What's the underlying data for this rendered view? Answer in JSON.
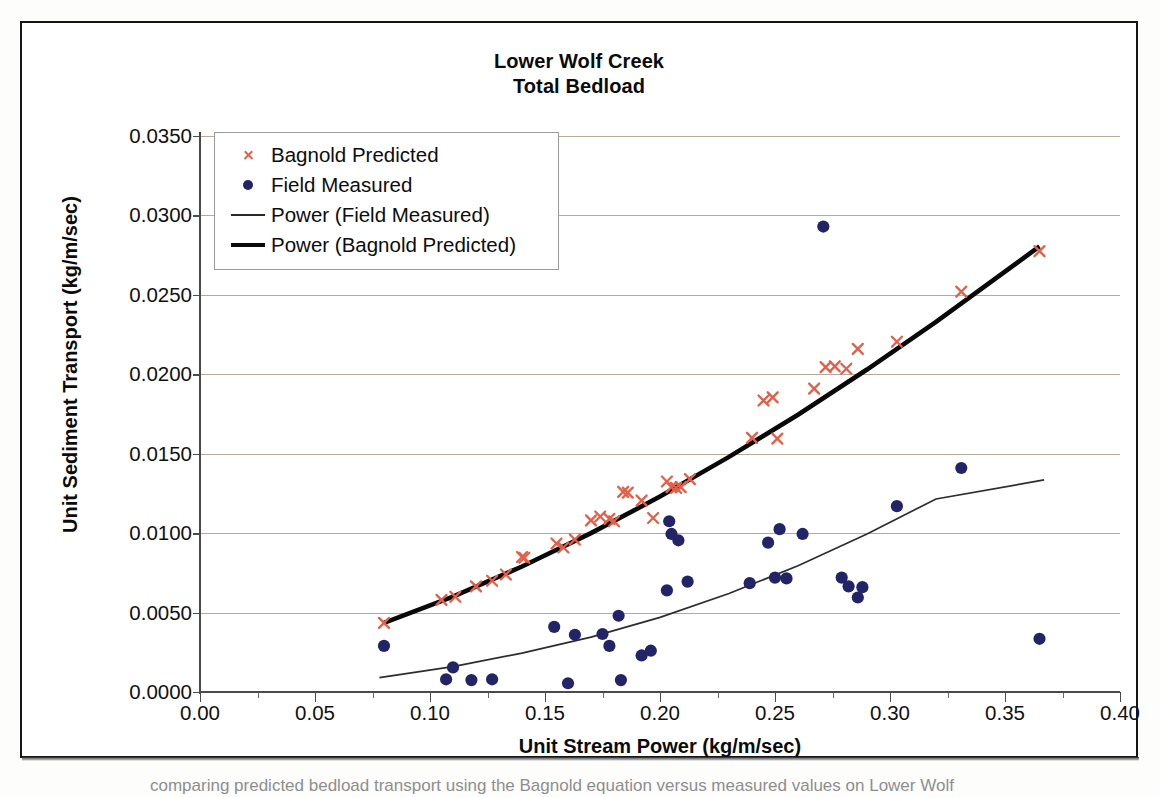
{
  "chart_data": {
    "type": "scatter",
    "title": "Lower Wolf Creek",
    "subtitle": "Total Bedload",
    "xlabel": "Unit Stream Power (kg/m/sec)",
    "ylabel": "Unit Sediment Transport (kg/m/sec)",
    "xlim": [
      0.0,
      0.4
    ],
    "ylim": [
      0.0,
      0.035
    ],
    "xticks": [
      "0.00",
      "0.05",
      "0.10",
      "0.15",
      "0.20",
      "0.25",
      "0.30",
      "0.35",
      "0.40"
    ],
    "xtick_values": [
      0.0,
      0.05,
      0.1,
      0.15,
      0.2,
      0.25,
      0.3,
      0.35,
      0.4
    ],
    "yticks": [
      "0.0000",
      "0.0050",
      "0.0100",
      "0.0150",
      "0.0200",
      "0.0250",
      "0.0300",
      "0.0350"
    ],
    "ytick_values": [
      0.0,
      0.005,
      0.01,
      0.015,
      0.02,
      0.025,
      0.03,
      0.035
    ],
    "grid": "horizontal",
    "legend_position": "upper-left-inside",
    "colors": {
      "bagnold_predicted": "#e2604a",
      "field_measured": "#232467",
      "power_field_measured": "#2d2d2d",
      "power_bagnold_predicted": "#090909",
      "gridline": "#b9a99a",
      "axis": "#4a4a4a"
    },
    "series": [
      {
        "name": "Bagnold Predicted",
        "marker": "cross",
        "color": "#e2604a",
        "points": [
          [
            0.08,
            0.00435
          ],
          [
            0.105,
            0.0058
          ],
          [
            0.111,
            0.006
          ],
          [
            0.12,
            0.00665
          ],
          [
            0.127,
            0.007
          ],
          [
            0.133,
            0.0074
          ],
          [
            0.14,
            0.0085
          ],
          [
            0.141,
            0.00845
          ],
          [
            0.155,
            0.00935
          ],
          [
            0.158,
            0.0091
          ],
          [
            0.163,
            0.0096
          ],
          [
            0.17,
            0.0108
          ],
          [
            0.174,
            0.01105
          ],
          [
            0.178,
            0.0109
          ],
          [
            0.18,
            0.01075
          ],
          [
            0.184,
            0.0126
          ],
          [
            0.186,
            0.01255
          ],
          [
            0.192,
            0.01205
          ],
          [
            0.197,
            0.01095
          ],
          [
            0.203,
            0.01325
          ],
          [
            0.205,
            0.0129
          ],
          [
            0.207,
            0.01285
          ],
          [
            0.209,
            0.0129
          ],
          [
            0.213,
            0.0134
          ],
          [
            0.24,
            0.016
          ],
          [
            0.245,
            0.01835
          ],
          [
            0.249,
            0.01855
          ],
          [
            0.251,
            0.01595
          ],
          [
            0.267,
            0.0191
          ],
          [
            0.272,
            0.02045
          ],
          [
            0.276,
            0.0205
          ],
          [
            0.281,
            0.02035
          ],
          [
            0.286,
            0.0216
          ],
          [
            0.303,
            0.02205
          ],
          [
            0.331,
            0.0252
          ],
          [
            0.365,
            0.02775
          ]
        ]
      },
      {
        "name": "Field Measured",
        "marker": "circle",
        "color": "#232467",
        "points": [
          [
            0.08,
            0.0029
          ],
          [
            0.107,
            0.0008
          ],
          [
            0.11,
            0.00155
          ],
          [
            0.118,
            0.00075
          ],
          [
            0.127,
            0.0008
          ],
          [
            0.154,
            0.0041
          ],
          [
            0.16,
            0.00055
          ],
          [
            0.163,
            0.0036
          ],
          [
            0.175,
            0.00365
          ],
          [
            0.178,
            0.0029
          ],
          [
            0.182,
            0.0048
          ],
          [
            0.183,
            0.00075
          ],
          [
            0.192,
            0.0023
          ],
          [
            0.196,
            0.0026
          ],
          [
            0.203,
            0.0064
          ],
          [
            0.204,
            0.01075
          ],
          [
            0.205,
            0.00995
          ],
          [
            0.208,
            0.00955
          ],
          [
            0.212,
            0.00695
          ],
          [
            0.239,
            0.00685
          ],
          [
            0.247,
            0.0094
          ],
          [
            0.25,
            0.0072
          ],
          [
            0.252,
            0.01025
          ],
          [
            0.255,
            0.00715
          ],
          [
            0.262,
            0.00995
          ],
          [
            0.271,
            0.0293
          ],
          [
            0.279,
            0.0072
          ],
          [
            0.282,
            0.00665
          ],
          [
            0.286,
            0.00595
          ],
          [
            0.288,
            0.0066
          ],
          [
            0.303,
            0.0117
          ],
          [
            0.331,
            0.0141
          ],
          [
            0.365,
            0.00335
          ]
        ]
      }
    ],
    "trendlines": [
      {
        "name": "Power (Bagnold Predicted)",
        "style": "thick",
        "color": "#090909",
        "x_range": [
          0.08,
          0.365
        ],
        "points": [
          [
            0.08,
            0.00435
          ],
          [
            0.11,
            0.006
          ],
          [
            0.14,
            0.0079
          ],
          [
            0.17,
            0.01
          ],
          [
            0.2,
            0.0123
          ],
          [
            0.23,
            0.0148
          ],
          [
            0.26,
            0.01745
          ],
          [
            0.29,
            0.0203
          ],
          [
            0.32,
            0.0233
          ],
          [
            0.365,
            0.02805
          ]
        ]
      },
      {
        "name": "Power (Field Measured)",
        "style": "thin",
        "color": "#2d2d2d",
        "x_range": [
          0.078,
          0.367
        ],
        "points": [
          [
            0.078,
            0.0009
          ],
          [
            0.11,
            0.0016
          ],
          [
            0.14,
            0.00245
          ],
          [
            0.17,
            0.00345
          ],
          [
            0.2,
            0.0047
          ],
          [
            0.23,
            0.0062
          ],
          [
            0.26,
            0.00795
          ],
          [
            0.29,
            0.00995
          ],
          [
            0.32,
            0.01215
          ],
          [
            0.367,
            0.01335
          ]
        ]
      }
    ]
  },
  "legend": {
    "items": [
      {
        "label": "Bagnold Predicted",
        "key": "cross-marker-icon"
      },
      {
        "label": "Field Measured",
        "key": "dot-marker-icon"
      },
      {
        "label": "Power (Field Measured)",
        "key": "thin-line-icon"
      },
      {
        "label": "Power (Bagnold Predicted)",
        "key": "thick-line-icon"
      }
    ]
  },
  "caption": {
    "text": "comparing predicted bedload transport using the Bagnold equation versus measured values on Lower Wolf"
  }
}
